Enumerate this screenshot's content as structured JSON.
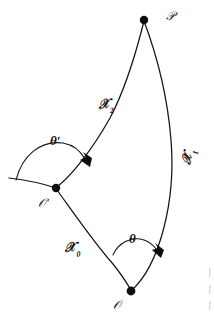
{
  "figure": {
    "background_color": "#ffffff",
    "stroke_color": "#151515",
    "points": [
      {
        "id": "P",
        "label": "𝒫",
        "plain": "P",
        "x": 144,
        "y": 20,
        "label_x": 166,
        "label_y": 10
      },
      {
        "id": "Op",
        "label": "𝒪′",
        "plain": "O'",
        "x": 56,
        "y": 188,
        "label_x": 38,
        "label_y": 197
      },
      {
        "id": "O",
        "label": "𝒪",
        "plain": "O",
        "x": 131,
        "y": 291,
        "label_x": 113,
        "label_y": 299
      }
    ],
    "curves": [
      {
        "id": "X2",
        "label": "𝒳",
        "subscript": "2",
        "plain": "X2",
        "from": "Op",
        "to": "P",
        "label_x": 97,
        "label_y": 98
      },
      {
        "id": "X1",
        "label": "𝒳",
        "subscript": "1",
        "plain": "X1",
        "from": "O",
        "to": "P",
        "label_x": 179,
        "label_y": 163
      },
      {
        "id": "X0",
        "label": "𝒳",
        "subscript": "0",
        "plain": "X0",
        "from": "Op",
        "to": "O",
        "label_x": 64,
        "label_y": 241
      }
    ],
    "angles": [
      {
        "id": "theta_prime",
        "label": "θ′",
        "plain": "theta-prime",
        "at_point": "Op",
        "label_x": 50,
        "label_y": 134
      },
      {
        "id": "theta",
        "label": "θ",
        "plain": "theta",
        "at_point": "O",
        "label_x": 129,
        "label_y": 232
      }
    ]
  }
}
